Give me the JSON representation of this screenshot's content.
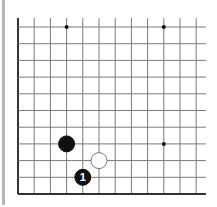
{
  "diagram": {
    "type": "go-board-fragment",
    "view": "bottom-left corner region",
    "columns": 12,
    "rows": 11,
    "edges": {
      "left": true,
      "bottom": true,
      "top": false,
      "right": false
    },
    "colors": {
      "background": "#ffffff",
      "grid_line": "#7a7a7a",
      "edge_line": "#333333",
      "black_stone": "#111111",
      "white_stone": "#ffffff",
      "side_bar": "#b4b4b4"
    },
    "star_points": [
      {
        "col": 3,
        "row_from_bottom": 10
      },
      {
        "col": 9,
        "row_from_bottom": 10
      },
      {
        "col": 9,
        "row_from_bottom": 3
      }
    ],
    "stones": [
      {
        "color": "black",
        "col": 3,
        "row_from_bottom": 3,
        "label": ""
      },
      {
        "color": "white",
        "col": 5,
        "row_from_bottom": 2,
        "label": ""
      },
      {
        "color": "black",
        "col": 4,
        "row_from_bottom": 1,
        "label": "1"
      }
    ]
  }
}
